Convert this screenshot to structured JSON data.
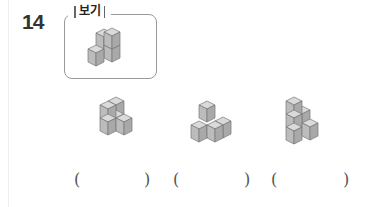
{
  "question": {
    "number": "14",
    "example_label": "보기"
  },
  "answers": [
    {
      "open": "(",
      "close": ")",
      "value": ""
    },
    {
      "open": "(",
      "close": ")",
      "value": ""
    },
    {
      "open": "(",
      "close": ")",
      "value": ""
    }
  ],
  "colors": {
    "cube_top": "#d9d9d9",
    "cube_left": "#bdbdbd",
    "cube_right": "#a8a8a8",
    "cube_edge": "#7a7a7a",
    "box_border": "#999999"
  }
}
